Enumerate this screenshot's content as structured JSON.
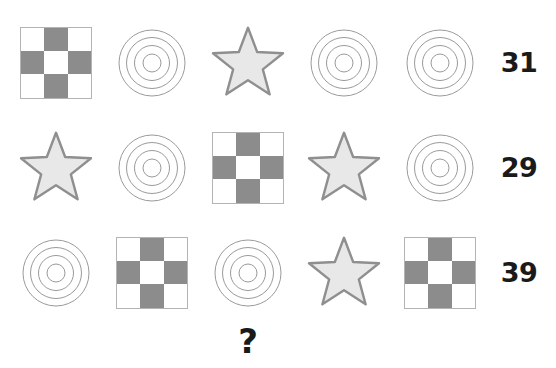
{
  "puzzle": {
    "title": "Shape sum logic puzzle",
    "rows": [
      {
        "shapes": [
          "checkerboard",
          "circles",
          "star",
          "circles",
          "circles"
        ],
        "sum": "31"
      },
      {
        "shapes": [
          "star",
          "circles",
          "checkerboard",
          "star",
          "circles"
        ],
        "sum": "29"
      },
      {
        "shapes": [
          "circles",
          "checkerboard",
          "circles",
          "star",
          "checkerboard"
        ],
        "sum": "39"
      }
    ],
    "question_mark": "?",
    "question_column": 2
  },
  "shape_spec": {
    "checkerboard": {
      "grid": [
        [
          "off",
          "on",
          "off"
        ],
        [
          "on",
          "off",
          "on"
        ],
        [
          "off",
          "on",
          "off"
        ]
      ],
      "fill_color": "#8c8c8c",
      "empty_color": "#ffffff",
      "border_color": "#b4b4b4",
      "size": 72
    },
    "circles": {
      "ring_count": 4,
      "radii": [
        33,
        25.5,
        17.5,
        9
      ],
      "stroke_color": "#9a9a9a",
      "stroke_width": 1,
      "fill": "none",
      "size": 72
    },
    "star": {
      "points": 5,
      "fill_color": "#e8e8e8",
      "stroke_color": "#8f8f8f",
      "stroke_width": 3,
      "size": 80
    }
  },
  "chart_data": {
    "type": "table",
    "categories": [
      "col1",
      "col2",
      "col3",
      "col4",
      "col5",
      "sum"
    ],
    "series": [
      {
        "name": "row1",
        "values": [
          "checkerboard",
          "circles",
          "star",
          "circles",
          "circles",
          31
        ]
      },
      {
        "name": "row2",
        "values": [
          "star",
          "circles",
          "checkerboard",
          "star",
          "circles",
          29
        ]
      },
      {
        "name": "row3",
        "values": [
          "circles",
          "checkerboard",
          "circles",
          "star",
          "checkerboard",
          39
        ]
      }
    ],
    "row_sums": [
      31,
      29,
      39
    ],
    "unknown_marker": "?",
    "xlabel": "",
    "ylabel": ""
  }
}
